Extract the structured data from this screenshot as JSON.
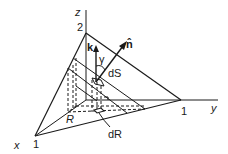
{
  "diagram": {
    "type": "3d-surface-projection",
    "axes": {
      "x": {
        "label": "x",
        "tick": "1"
      },
      "y": {
        "label": "y",
        "tick": "1"
      },
      "z": {
        "label": "z",
        "tick": "2"
      }
    },
    "vectors": {
      "k": {
        "label": "k"
      },
      "n": {
        "label": "n̂"
      }
    },
    "annotations": {
      "angle": "γ",
      "surface_element": "dS",
      "region": "R",
      "area_element": "dR"
    },
    "colors": {
      "stroke": "#1a1a1a",
      "background": "#ffffff"
    }
  }
}
